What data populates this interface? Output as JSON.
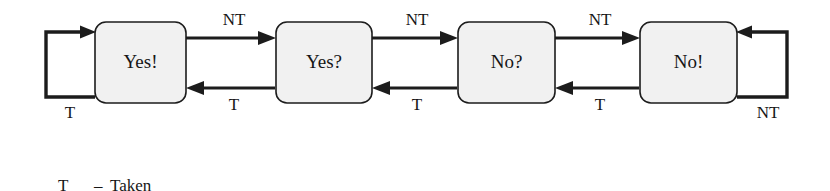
{
  "diagram": {
    "colors": {
      "box_fill": "#f1f1f1",
      "box_stroke": "#1c1c1c",
      "line": "#1c1c1c",
      "text": "#161616",
      "background": "#ffffff"
    },
    "states": [
      {
        "id": "yes-strong",
        "label": "Yes!"
      },
      {
        "id": "yes-weak",
        "label": "Yes?"
      },
      {
        "id": "no-weak",
        "label": "No?"
      },
      {
        "id": "no-strong",
        "label": "No!"
      }
    ],
    "transitions": [
      {
        "id": "t1-forward",
        "from": "yes-strong",
        "to": "yes-weak",
        "label": "NT",
        "direction": "right",
        "position": "top"
      },
      {
        "id": "t1-back",
        "from": "yes-weak",
        "to": "yes-strong",
        "label": "T",
        "direction": "left",
        "position": "bottom"
      },
      {
        "id": "t2-forward",
        "from": "yes-weak",
        "to": "no-weak",
        "label": "NT",
        "direction": "right",
        "position": "top"
      },
      {
        "id": "t2-back",
        "from": "no-weak",
        "to": "yes-weak",
        "label": "T",
        "direction": "left",
        "position": "bottom"
      },
      {
        "id": "t3-forward",
        "from": "no-weak",
        "to": "no-strong",
        "label": "NT",
        "direction": "right",
        "position": "top"
      },
      {
        "id": "t3-back",
        "from": "no-strong",
        "to": "no-weak",
        "label": "T",
        "direction": "left",
        "position": "bottom"
      }
    ],
    "self_loops": [
      {
        "id": "loop-yes-strong",
        "state": "yes-strong",
        "label": "T",
        "side": "left"
      },
      {
        "id": "loop-no-strong",
        "state": "no-strong",
        "label": "NT",
        "side": "right"
      }
    ],
    "legend": [
      {
        "key": "T",
        "dash": "–",
        "meaning": "Taken"
      },
      {
        "key": "NT",
        "dash": "–",
        "meaning": "Not taken"
      }
    ]
  }
}
